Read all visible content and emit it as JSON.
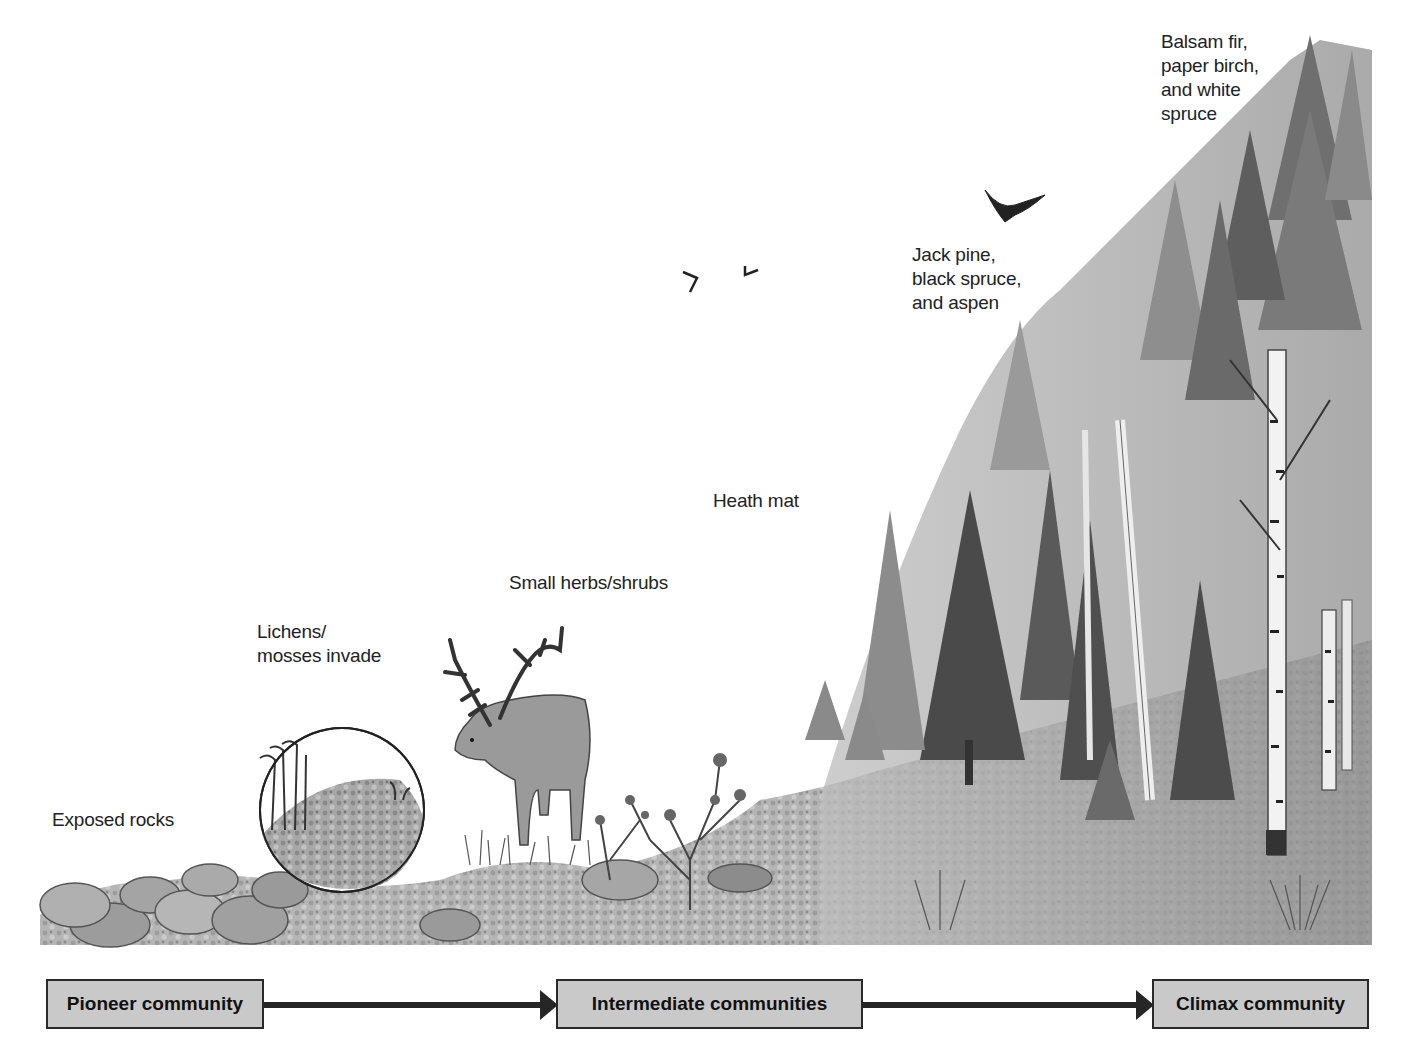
{
  "diagram": {
    "type": "ecological succession illustration",
    "palette": {
      "background": "#ffffff",
      "label_text": "#222222",
      "stage_box_fill": "#c9c9c9",
      "stage_box_border": "#2a2a2a",
      "arrow": "#262626"
    },
    "scene_labels": [
      {
        "id": "exposed-rocks",
        "text": "Exposed rocks"
      },
      {
        "id": "lichens-mosses",
        "text": "Lichens/\nmosses invade"
      },
      {
        "id": "small-herbs",
        "text": "Small herbs/shrubs"
      },
      {
        "id": "heath-mat",
        "text": "Heath mat"
      },
      {
        "id": "jack-pine",
        "text": "Jack pine,\nblack spruce,\nand aspen"
      },
      {
        "id": "balsam-fir",
        "text": "Balsam fir,\npaper birch,\nand white\nspruce"
      }
    ],
    "stages": [
      {
        "label": "Pioneer community"
      },
      {
        "label": "Intermediate communities"
      },
      {
        "label": "Climax community"
      }
    ],
    "illustration_elements": [
      "exposed-rocks-icon",
      "moss-magnifier-circle-icon",
      "caribou-icon",
      "shrub-icon",
      "birds-icon",
      "conifer-trees-icon",
      "birch-trees-icon"
    ]
  }
}
